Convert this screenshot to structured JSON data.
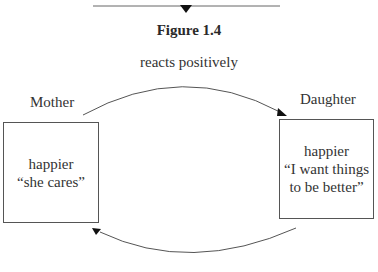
{
  "figure": {
    "title": "Figure 1.4",
    "top_arrow_label": "reacts positively"
  },
  "nodes": [
    {
      "id": "mother",
      "label": "Mother",
      "lines": [
        "happier",
        "“she cares”"
      ]
    },
    {
      "id": "daughter",
      "label": "Daughter",
      "lines": [
        "happier",
        "“I want things",
        "to be better”"
      ]
    }
  ],
  "edges": [
    {
      "from": "mother",
      "to": "daughter",
      "label": "reacts positively"
    },
    {
      "from": "daughter",
      "to": "mother",
      "label": ""
    }
  ],
  "colors": {
    "line": "#555555",
    "text": "#333333",
    "background": "#ffffff"
  }
}
